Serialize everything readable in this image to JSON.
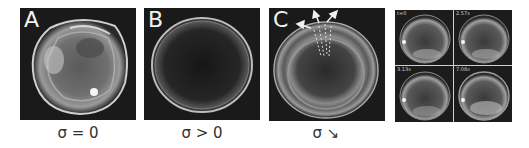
{
  "figure": {
    "panels": [
      {
        "id": "A",
        "label": "A",
        "caption": "σ = 0",
        "description": "irregular vesicle, tension zero"
      },
      {
        "id": "B",
        "label": "B",
        "caption": "σ > 0",
        "description": "smooth circular vesicle under tension"
      },
      {
        "id": "C",
        "label": "C",
        "caption": "σ ↘",
        "description": "vesicle with outward arrows indicating decreasing tension"
      }
    ],
    "time_series": {
      "frames": [
        {
          "time": "t=0"
        },
        {
          "time": "2.57s"
        },
        {
          "time": "3.13s"
        },
        {
          "time": "7.08s"
        }
      ]
    },
    "colors": {
      "background": "#ffffff",
      "panel_bg": "#1a1a1a",
      "label_text": "#f2f2f2",
      "caption_text": "#333333"
    }
  }
}
